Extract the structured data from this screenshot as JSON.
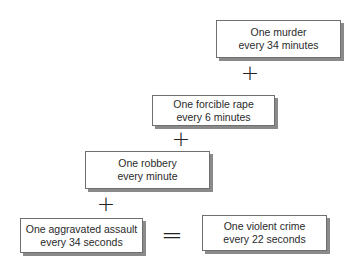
{
  "diagram": {
    "type": "equation-flow",
    "boxes": [
      {
        "id": "murder",
        "line1": "One murder",
        "line2": "every 34 minutes"
      },
      {
        "id": "forcible-rape",
        "line1": "One forcible rape",
        "line2": "every 6 minutes"
      },
      {
        "id": "robbery",
        "line1": "One robbery",
        "line2": "every minute"
      },
      {
        "id": "aggravated-assault",
        "line1": "One aggravated assault",
        "line2": "every 34 seconds"
      },
      {
        "id": "violent-crime",
        "line1": "One violent crime",
        "line2": "every 22 seconds"
      }
    ],
    "operators": {
      "plus": "+",
      "equals": "="
    }
  }
}
